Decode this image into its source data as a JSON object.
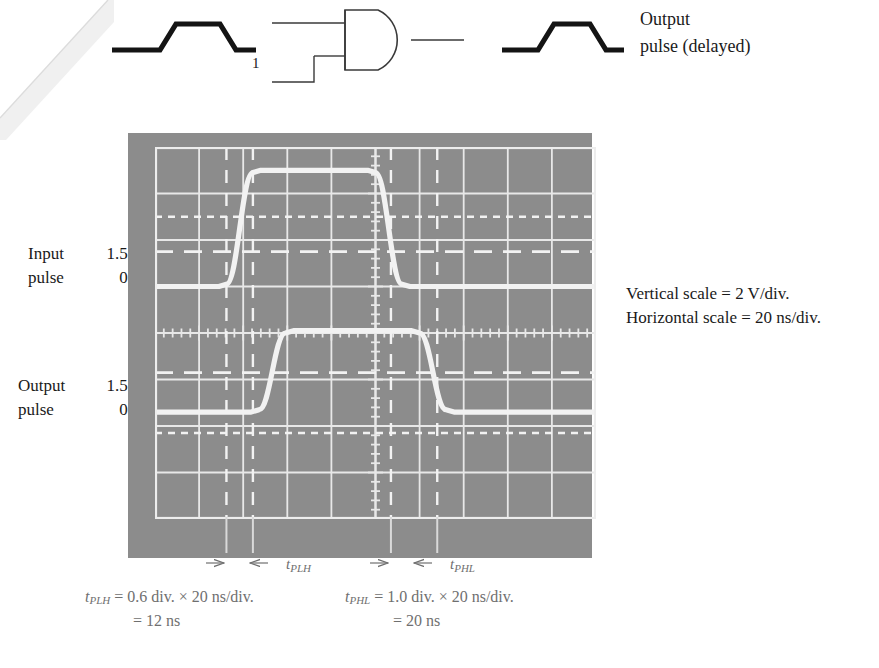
{
  "schematic": {
    "gate_input_label": "1",
    "gate_type": "and-gate",
    "output_caption_line1": "Output",
    "output_caption_line2": "pulse (delayed)",
    "input_waveform_name": "input-pulse-waveform",
    "output_waveform_name": "output-pulse-waveform"
  },
  "left_labels": {
    "input_name": "Input",
    "input_pulse": "pulse",
    "input_v_high": "1.5 V",
    "input_v_low": "0 V",
    "output_name": "Output",
    "output_pulse": "pulse",
    "output_v_high": "1.5 V",
    "output_v_low": "0 V"
  },
  "scale_notes": {
    "vertical": "Vertical scale = 2 V/div.",
    "horizontal": "Horizontal scale = 20 ns/div."
  },
  "measurements": {
    "tplh_label": "t",
    "tplh_sub": "PLH",
    "phl_label": "t",
    "phl_sub": "PHL",
    "eq_plh_line1": "t_PLH = 0.6 div. × 20 ns/div.",
    "eq_plh_line2": "= 12 ns",
    "eq_phl_line1": "t_PHL = 1.0 div. × 20 ns/div.",
    "eq_phl_line2": "= 20 ns",
    "tplh_divisions": 0.6,
    "tplh_value_ns": 12,
    "tphl_divisions": 1.0,
    "tphl_value_ns": 20,
    "timebase_ns_per_div": 20,
    "volts_per_div": 2
  },
  "chart_data": {
    "type": "line",
    "xlabel": "Time (20 ns/div.)",
    "ylabel": "Voltage (2 V/div.)",
    "grid": true,
    "x_divisions": 10,
    "y_divisions": 8,
    "xlim": [
      0,
      10
    ],
    "ylim": [
      0,
      8
    ],
    "legend": "none",
    "series": [
      {
        "name": "Input pulse",
        "x": [
          0.0,
          1.45,
          1.62,
          2.22,
          2.4,
          4.82,
          5.0,
          5.6,
          5.78,
          10.0
        ],
        "y": [
          5.0,
          5.0,
          5.05,
          7.45,
          7.5,
          7.5,
          7.45,
          5.05,
          5.0,
          5.0
        ],
        "baseline_div": 5.0,
        "top_div": 7.5
      },
      {
        "name": "Output pulse",
        "x": [
          0.0,
          2.18,
          2.36,
          2.96,
          3.14,
          5.82,
          6.0,
          6.6,
          6.78,
          10.0
        ],
        "y": [
          2.3,
          2.3,
          2.35,
          4.0,
          4.05,
          4.05,
          4.0,
          2.35,
          2.3,
          2.3
        ],
        "baseline_div": 2.3,
        "top_div": 4.05
      }
    ],
    "cursors": {
      "vertical_div": [
        1.62,
        2.22,
        5.35,
        6.4
      ],
      "horizontal_dashed_div": [
        6.5,
        5.75,
        3.15,
        1.85
      ]
    },
    "annotations": [
      {
        "text": "1.5 V threshold (input)",
        "y_div": 5.75
      },
      {
        "text": "1.5 V threshold (output)",
        "y_div": 3.15
      }
    ]
  },
  "colors": {
    "screen_bg": "#8c8c8c",
    "trace": "#f2f2f2",
    "grid": "#e8e8e8",
    "ink": "#1a1a1a",
    "annotation_gray": "#6f6f6f"
  }
}
